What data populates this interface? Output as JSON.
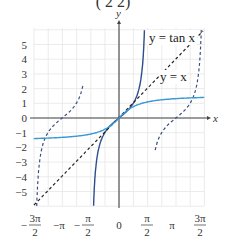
{
  "chart_data": {
    "type": "line",
    "title": "",
    "title_fragment": "(  2   2)",
    "xlabel": "x",
    "ylabel": "y",
    "xlim": [
      -4.712,
      4.712
    ],
    "ylim": [
      -6,
      6
    ],
    "grid": true,
    "x_ticks": [
      {
        "value": -4.712,
        "numerator": "3π",
        "denominator": "2",
        "sign": "−"
      },
      {
        "value": -3.1416,
        "numerator": "π",
        "denominator": "",
        "sign": "−"
      },
      {
        "value": -1.5708,
        "numerator": "π",
        "denominator": "2",
        "sign": "−"
      },
      {
        "value": 0,
        "numerator": "0",
        "denominator": "",
        "sign": ""
      },
      {
        "value": 1.5708,
        "numerator": "π",
        "denominator": "2",
        "sign": ""
      },
      {
        "value": 3.1416,
        "numerator": "π",
        "denominator": "",
        "sign": ""
      },
      {
        "value": 4.712,
        "numerator": "3π",
        "denominator": "2",
        "sign": ""
      }
    ],
    "y_ticks": [
      {
        "value": 5,
        "label": "5"
      },
      {
        "value": 4,
        "label": "4"
      },
      {
        "value": 3,
        "label": "3"
      },
      {
        "value": 2,
        "label": "2"
      },
      {
        "value": 1,
        "label": "1"
      },
      {
        "value": 0,
        "label": "0"
      },
      {
        "value": -1,
        "label": "−1"
      },
      {
        "value": -2,
        "label": "−2"
      },
      {
        "value": -3,
        "label": "−3"
      },
      {
        "value": -4,
        "label": "−4"
      },
      {
        "value": -5,
        "label": "−5"
      }
    ],
    "series": [
      {
        "name": "tan x (principal branch)",
        "function": "tan",
        "domain": [
          -1.405,
          1.405
        ],
        "style": "solid",
        "color": "#2e4d8f"
      },
      {
        "name": "tan x (left branch)",
        "function": "tan",
        "domain": [
          -4.547,
          -2.0
        ],
        "style": "dashed",
        "color": "#3d4f80"
      },
      {
        "name": "tan x (right branch)",
        "function": "tan",
        "domain": [
          2.0,
          4.547
        ],
        "style": "dashed",
        "color": "#3d4f80"
      },
      {
        "name": "y = x",
        "function": "identity",
        "domain": [
          -4.712,
          4.712
        ],
        "style": "dashed",
        "color": "#222222"
      },
      {
        "name": "arctan x",
        "function": "arctan",
        "domain": [
          -4.712,
          4.712
        ],
        "style": "solid",
        "color": "#3b98d6"
      }
    ],
    "annotations": [
      {
        "text": "y = tan x",
        "near": "top-right"
      },
      {
        "text": "y = x",
        "near": "upper-right"
      }
    ],
    "legend": "none"
  }
}
